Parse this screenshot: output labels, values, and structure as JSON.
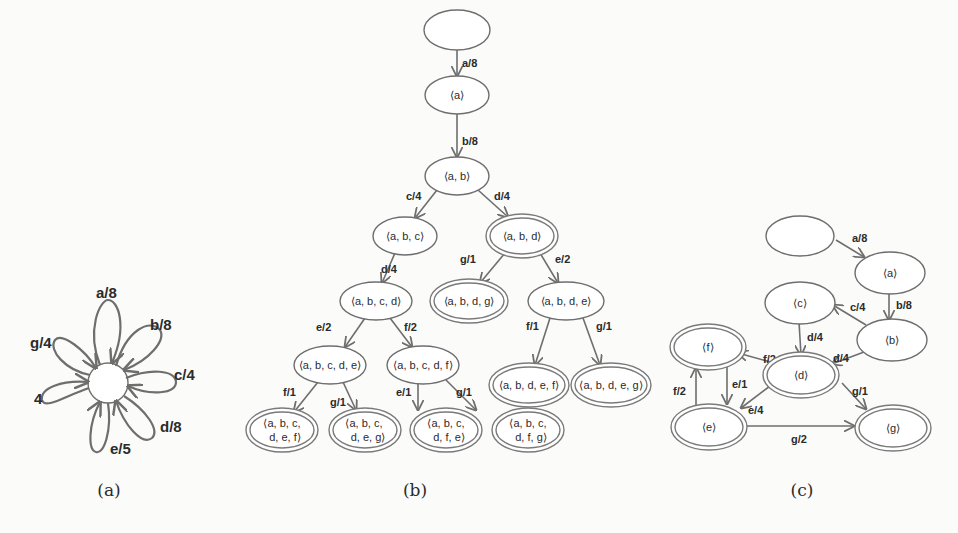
{
  "figure": {
    "panels": [
      {
        "id": "a",
        "caption": "(a)"
      },
      {
        "id": "b",
        "caption": "(b)"
      },
      {
        "id": "c",
        "caption": "(c)"
      }
    ]
  },
  "panel_a": {
    "caption": "(a)",
    "center_node": "",
    "petals": [
      {
        "label": "a/8"
      },
      {
        "label": "b/8"
      },
      {
        "label": "c/4"
      },
      {
        "label": "d/8"
      },
      {
        "label": "e/5"
      },
      {
        "label": "4"
      },
      {
        "label": "g/4"
      }
    ]
  },
  "panel_b": {
    "caption": "(b)",
    "nodes": {
      "root": "",
      "a": "⟨a⟩",
      "ab": "⟨a, b⟩",
      "abc": "⟨a, b, c⟩",
      "abd": "⟨a, b, d⟩",
      "abcd": "⟨a, b, c, d⟩",
      "abdg": "⟨a, b, d, g⟩",
      "abde": "⟨a, b, d, e⟩",
      "abcde": "⟨a, b, c, d, e⟩",
      "abcdf": "⟨a, b, c, d, f⟩",
      "abdef": "⟨a, b, d, e, f⟩",
      "abdeg": "⟨a, b, d, e, g⟩",
      "abcdef_1": "⟨a, b, c,",
      "abcdef_2": "d, e, f⟩",
      "abcdeg_1": "⟨a, b, c,",
      "abcdeg_2": "d, e, g⟩",
      "abcdfe_1": "⟨a, b, c,",
      "abcdfe_2": "d, f, e⟩",
      "abcdfg_1": "⟨a, b, c,",
      "abcdfg_2": "d, f, g⟩"
    },
    "edges": {
      "root_a": "a/8",
      "a_ab": "b/8",
      "ab_abc": "c/4",
      "ab_abd": "d/4",
      "abc_abcd": "d/4",
      "abd_abdg": "g/1",
      "abd_abde": "e/2",
      "abcd_abcde": "e/2",
      "abcd_abcdf": "f/2",
      "abde_abdef": "f/1",
      "abde_abdeg": "g/1",
      "abcde_abcdef": "f/1",
      "abcde_abcdeg": "g/1",
      "abcdf_abcdfe": "e/1",
      "abcdf_abcdfg": "g/1"
    }
  },
  "panel_c": {
    "caption": "(c)",
    "nodes": {
      "root": "",
      "a": "⟨a⟩",
      "b": "⟨b⟩",
      "c": "⟨c⟩",
      "d": "⟨d⟩",
      "e": "⟨e⟩",
      "f": "⟨f⟩",
      "g": "⟨g⟩"
    },
    "edges": {
      "root_a": "a/8",
      "a_b": "b/8",
      "b_c": "c/4",
      "c_d": "d/4",
      "b_d": "d/4",
      "d_f": "f/2",
      "f_e": "e/1",
      "e_f": "f/2",
      "d_e": "e/4",
      "d_g": "g/1",
      "e_g": "g/2"
    }
  },
  "colors": {
    "background": "#fbfbfa",
    "stroke": "#6e6e6e",
    "text": "#2b2b2b"
  }
}
